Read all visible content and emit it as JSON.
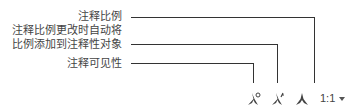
{
  "callouts": {
    "annotation_scale": "注释比例",
    "auto_add_line1": "注释比例更改时自动将",
    "auto_add_line2": "比例添加到注释性对象",
    "visibility": "注释可见性"
  },
  "statusbar": {
    "scale_value": "1:1",
    "icons": [
      "annotation-visibility-icon",
      "auto-add-scale-icon",
      "annotation-scale-icon"
    ]
  }
}
